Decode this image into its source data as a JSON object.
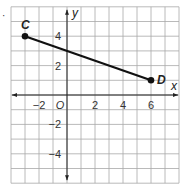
{
  "bullet": "·",
  "chart_data": {
    "type": "line",
    "title": "",
    "xlabel": "x",
    "ylabel": "y",
    "xlim": [
      -4,
      8
    ],
    "ylim": [
      -6,
      6
    ],
    "grid": true,
    "grid_step": 1,
    "x_tick_labels": [
      {
        "value": -2,
        "label": "−2"
      },
      {
        "value": 0,
        "label": "O"
      },
      {
        "value": 2,
        "label": "2"
      },
      {
        "value": 4,
        "label": "4"
      },
      {
        "value": 6,
        "label": "6"
      }
    ],
    "y_tick_labels": [
      {
        "value": 4,
        "label": "4"
      },
      {
        "value": 2,
        "label": "2"
      },
      {
        "value": -2,
        "label": "−2"
      },
      {
        "value": -4,
        "label": "−4"
      }
    ],
    "series": [
      {
        "name": "segment CD",
        "points": [
          {
            "label": "C",
            "x": -3,
            "y": 4
          },
          {
            "label": "D",
            "x": 6,
            "y": 1
          }
        ]
      }
    ],
    "colors": {
      "grid": "#a8a8a8",
      "axis": "#222222",
      "segment": "#111111"
    }
  }
}
